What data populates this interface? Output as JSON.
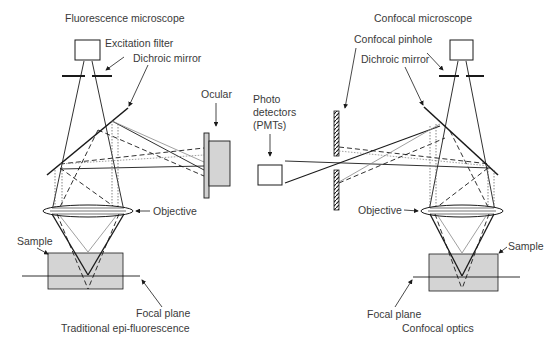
{
  "left": {
    "title": "Fluorescence microscope",
    "labels": {
      "excitation_filter": "Excitation filter",
      "dichroic_mirror": "Dichroic mirror",
      "ocular": "Ocular",
      "objective": "Objective",
      "sample": "Sample",
      "focal_plane": "Focal plane"
    },
    "caption": "Traditional epi-fluorescence"
  },
  "right": {
    "title": "Confocal microscope",
    "labels": {
      "confocal_pinhole": "Confocal pinhole",
      "dichroic_mirror": "Dichroic mirror",
      "photo_detectors_1": "Photo",
      "photo_detectors_2": "detectors",
      "photo_detectors_3": "(PMTs)",
      "objective": "Objective",
      "sample": "Sample",
      "focal_plane": "Focal plane"
    },
    "caption": "Confocal optics"
  },
  "colors": {
    "line": "#1a1a1a",
    "sample_fill": "#d4d4d4",
    "box_fill": "#ffffff",
    "text": "#3a3a3a"
  }
}
